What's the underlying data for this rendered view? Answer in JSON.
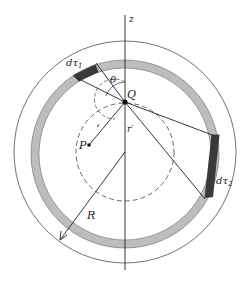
{
  "diagram": {
    "labels": {
      "axis": "z",
      "point_q": "Q",
      "point_p": "P",
      "angle": "θ",
      "radius_big": "R",
      "r_prime": "r′",
      "r_script": "𝓇",
      "dtau1": "dτ",
      "dtau1_sub": "1",
      "dtau2": "dτ",
      "dtau2_sub": "2"
    },
    "colors": {
      "line": "#222222",
      "shell_fill": "#bdbdbd",
      "volume_element_fill": "#3a3a3a",
      "background": "#ffffff"
    }
  }
}
